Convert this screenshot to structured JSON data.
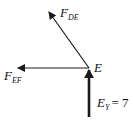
{
  "diagram": {
    "type": "free-body diagram",
    "node": {
      "label": "E"
    },
    "forces": [
      {
        "id": "F_DE",
        "base": "F",
        "subscript": "DE",
        "direction": "up-left",
        "from": [
          89,
          68
        ],
        "to": [
          48,
          11
        ]
      },
      {
        "id": "F_EF",
        "base": "F",
        "subscript": "EF",
        "direction": "left",
        "from": [
          89,
          68
        ],
        "to": [
          17,
          68
        ]
      },
      {
        "id": "E_Y",
        "base": "E",
        "subscript": "Y",
        "equals": "= 7",
        "direction": "up",
        "from": [
          89,
          117
        ],
        "to": [
          89,
          68
        ]
      }
    ],
    "colors": {
      "line": "#1a1a1a",
      "background": "#ffffff"
    }
  }
}
